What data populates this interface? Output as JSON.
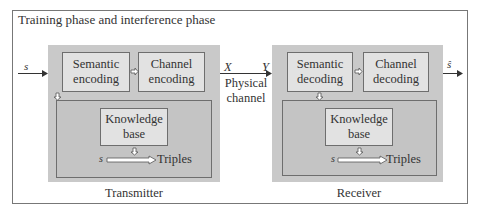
{
  "title": "Training phase and interference phase",
  "transmitter": {
    "label": "Transmitter",
    "input_symbol": "s",
    "semantic_block": [
      "Semantic",
      "encoding"
    ],
    "channel_block": [
      "Channel",
      "encoding"
    ],
    "knowledge_base": [
      "Knowledge",
      "base"
    ],
    "kb_input": "s",
    "kb_output": "Triples"
  },
  "channel": {
    "x_label": "X",
    "y_label": "Y",
    "name": [
      "Physical",
      "channel"
    ]
  },
  "receiver": {
    "label": "Receiver",
    "output_symbol": "ŝ",
    "semantic_block": [
      "Semantic",
      "decoding"
    ],
    "channel_block": [
      "Channel",
      "decoding"
    ],
    "knowledge_base": [
      "Knowledge",
      "base"
    ],
    "kb_input": "s",
    "kb_output": "Triples"
  },
  "colors": {
    "panel_bg": "#c9c9c9",
    "box_bg": "#e2e2e2",
    "border": "#6e6e6e"
  }
}
